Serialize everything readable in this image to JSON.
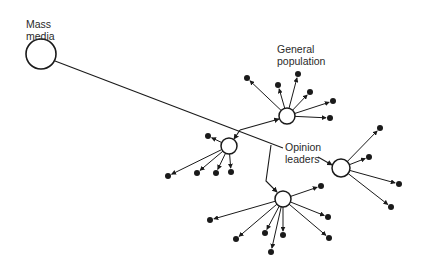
{
  "diagram": {
    "colors": {
      "stroke": "#1a1a1a",
      "dot": "#1a1a1a",
      "background": "#ffffff"
    },
    "labels": [
      {
        "id": "mass-media",
        "text": "Mass\nmedia",
        "x": 26,
        "y": 18
      },
      {
        "id": "general-population",
        "text": "General\npopulation",
        "x": 277,
        "y": 43
      },
      {
        "id": "opinion-leaders",
        "text": "Opinion\nleaders",
        "x": 285,
        "y": 141
      }
    ],
    "source": {
      "id": "mass-media",
      "cx": 41,
      "cy": 54,
      "r": 15
    },
    "main_line": {
      "x1": 55,
      "y1": 61,
      "x2": 283,
      "y2": 148
    },
    "opinion_leaders": [
      {
        "id": "leader-upper",
        "cx": 287,
        "cy": 116,
        "r": 8,
        "incoming": [
          [
            240,
            130
          ],
          [
            279,
            119
          ]
        ],
        "followers": [
          [
            247,
            78
          ],
          [
            278,
            85
          ],
          [
            298,
            74
          ],
          [
            310,
            92
          ],
          [
            333,
            101
          ],
          [
            330,
            118
          ]
        ]
      },
      {
        "id": "leader-left",
        "cx": 229,
        "cy": 146,
        "r": 8,
        "incoming": [
          [
            240,
            130
          ],
          [
            234,
            139
          ]
        ],
        "followers": [
          [
            208,
            136
          ],
          [
            168,
            176
          ],
          [
            197,
            173
          ],
          [
            216,
            173
          ],
          [
            231,
            172
          ]
        ]
      },
      {
        "id": "leader-right",
        "cx": 341,
        "cy": 168,
        "r": 9,
        "incoming": [
          [
            318,
            157
          ],
          [
            332,
            165
          ]
        ],
        "followers": [
          [
            380,
            128
          ],
          [
            369,
            157
          ],
          [
            399,
            184
          ],
          [
            391,
            207
          ]
        ]
      },
      {
        "id": "leader-bottom",
        "cx": 283,
        "cy": 199,
        "r": 8,
        "incoming": [
          [
            271,
            145
          ],
          [
            266,
            181
          ],
          [
            277,
            192
          ]
        ],
        "followers": [
          [
            321,
            186
          ],
          [
            210,
            220
          ],
          [
            236,
            239
          ],
          [
            265,
            233
          ],
          [
            283,
            235
          ],
          [
            271,
            252
          ],
          [
            328,
            217
          ],
          [
            329,
            238
          ]
        ]
      }
    ],
    "dot_radius": 3
  }
}
